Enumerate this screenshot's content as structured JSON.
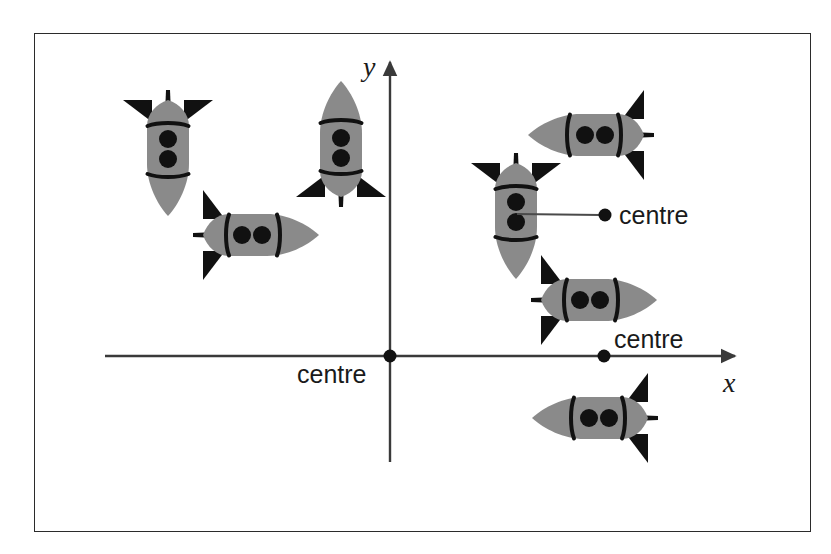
{
  "figure": {
    "background_color": "#ffffff",
    "frame": {
      "border_color": "#2b2b2b",
      "x": 34,
      "y": 33,
      "width": 777,
      "height": 499
    }
  },
  "axes": {
    "color": "#3a3a3a",
    "origin": {
      "x": 390,
      "y": 356
    },
    "x_axis": {
      "label": "x",
      "start_x": 105,
      "end_x": 735,
      "y": 356,
      "arrow": "right-arrow",
      "label_pos": {
        "x": 723,
        "y": 392
      }
    },
    "y_axis": {
      "label": "y",
      "x": 390,
      "top_y": 62,
      "bottom_y": 462,
      "arrow": "up-arrow",
      "label_pos": {
        "x": 363,
        "y": 76
      }
    }
  },
  "rocket": {
    "body_color": "#8a8a8a",
    "detail_color": "#111111",
    "fin_color": "#111111",
    "porthole_count": 2
  },
  "rockets": [
    {
      "name": "rocket-top-left-inverted",
      "cx": 168,
      "cy": 152,
      "rotation": 180,
      "scale": 1.0
    },
    {
      "name": "rocket-left-pointing-right",
      "cx": 255,
      "cy": 235,
      "rotation": 90,
      "scale": 1.0
    },
    {
      "name": "rocket-upright-near-y-axis",
      "cx": 341,
      "cy": 145,
      "rotation": 0,
      "scale": 1.0
    },
    {
      "name": "rocket-upper-right-pointing-left",
      "cx": 592,
      "cy": 135,
      "rotation": 270,
      "scale": 1.0
    },
    {
      "name": "rocket-centre-labelled-inverted",
      "cx": 516,
      "cy": 215,
      "rotation": 180,
      "scale": 1.0
    },
    {
      "name": "rocket-mid-right-pointing-right",
      "cx": 593,
      "cy": 300,
      "rotation": 90,
      "scale": 1.0
    },
    {
      "name": "rocket-bottom-right-pointing-left",
      "cx": 596,
      "cy": 418,
      "rotation": 270,
      "scale": 1.0
    }
  ],
  "markers": [
    {
      "name": "centre-marker-origin",
      "label": "centre",
      "dot": {
        "x": 390,
        "y": 356
      },
      "label_pos": {
        "x": 297,
        "y": 383
      },
      "anchor": "start",
      "has_leader": false
    },
    {
      "name": "centre-marker-x-axis",
      "label": "centre",
      "dot": {
        "x": 604,
        "y": 356
      },
      "label_pos": {
        "x": 614,
        "y": 348
      },
      "anchor": "start",
      "has_leader": false
    },
    {
      "name": "centre-marker-rocket",
      "label": "centre",
      "dot": {
        "x": 605,
        "y": 215
      },
      "label_pos": {
        "x": 619,
        "y": 224
      },
      "anchor": "start",
      "has_leader": true,
      "leader": {
        "x1": 517,
        "y1": 214,
        "x2": 601,
        "y2": 215
      }
    }
  ]
}
